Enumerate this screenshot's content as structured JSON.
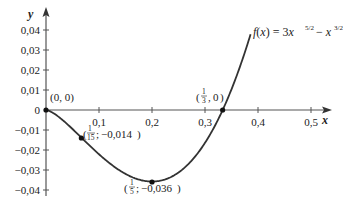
{
  "chart_data": {
    "type": "line",
    "title": "",
    "function_label": "f(x) = 3x^(5/2) − x^(3/2)",
    "function_parts": {
      "lhs": "f(x) = 3x",
      "exp1": "5/2",
      "minus": " − x",
      "exp2": "3/2"
    },
    "xlabel": "x",
    "ylabel": "y",
    "xlim": [
      0,
      0.55
    ],
    "ylim": [
      -0.045,
      0.045
    ],
    "x_ticks": [
      0.1,
      0.2,
      0.3,
      0.4,
      0.5
    ],
    "x_tick_labels": [
      "0,1",
      "0,2",
      "0,3",
      "0,4",
      "0,5"
    ],
    "y_ticks": [
      0.04,
      0.03,
      0.02,
      0.01,
      0,
      -0.01,
      -0.02,
      -0.03,
      -0.04
    ],
    "y_tick_labels": [
      "0,04",
      "0,03",
      "0,02",
      "0,01",
      "0",
      "−0,01",
      "−0,02",
      "−0,03",
      "−0,04"
    ],
    "grid": false,
    "legend": "none",
    "series": [
      {
        "name": "f(x) = 3x^(5/2) − x^(3/2)",
        "x": [
          0,
          0.02,
          0.04,
          0.0667,
          0.1,
          0.14,
          0.2,
          0.26,
          0.3,
          0.3333,
          0.36,
          0.385
        ],
        "y": [
          0,
          -0.0027,
          -0.0072,
          -0.0138,
          -0.0221,
          -0.0303,
          -0.0358,
          -0.0291,
          -0.0164,
          0,
          0.0168,
          0.0394
        ]
      }
    ],
    "annotations": [
      {
        "text": "(0, 0)",
        "x": 0,
        "y": 0,
        "label": "(0, 0)"
      },
      {
        "text": "(1/15; −0,014)",
        "x": 0.0667,
        "y": -0.014,
        "num": "1",
        "den": "15",
        "val": "−0,014"
      },
      {
        "text": "(1/5; −0,036)",
        "x": 0.2,
        "y": -0.036,
        "num": "1",
        "den": "5",
        "val": "−0,036"
      },
      {
        "text": "(1/3, 0)",
        "x": 0.3333,
        "y": 0,
        "num": "1",
        "den": "3",
        "val": "0"
      }
    ]
  }
}
